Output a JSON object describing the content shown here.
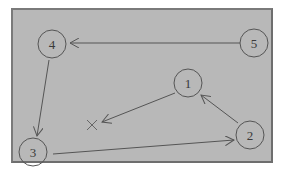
{
  "diagram": {
    "colors": {
      "background": "#b8b8b8",
      "frame": "#7a7a7a",
      "stroke": "#555555",
      "text": "#3a3a3a"
    },
    "nodes": [
      {
        "id": "1",
        "label": "1",
        "x": 188,
        "y": 83
      },
      {
        "id": "2",
        "label": "2",
        "x": 250,
        "y": 135
      },
      {
        "id": "3",
        "label": "3",
        "x": 33,
        "y": 152
      },
      {
        "id": "4",
        "label": "4",
        "x": 52,
        "y": 44
      },
      {
        "id": "5",
        "label": "5",
        "x": 254,
        "y": 43
      }
    ],
    "marker": {
      "label": "×",
      "x": 92,
      "y": 125
    },
    "edges": [
      {
        "from": "5",
        "to": "4"
      },
      {
        "from": "4",
        "to": "3"
      },
      {
        "from": "3",
        "to": "2"
      },
      {
        "from": "2",
        "to": "1"
      },
      {
        "from": "1",
        "to": "x"
      }
    ]
  }
}
